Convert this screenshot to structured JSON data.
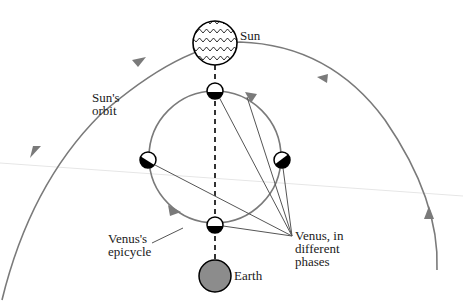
{
  "diagram": {
    "labels": {
      "sun": "Sun",
      "sun_orbit_line1": "Sun's",
      "sun_orbit_line2": "orbit",
      "epicycle_line1": "Venus's",
      "epicycle_line2": "epicycle",
      "phases_line1": "Venus, in",
      "phases_line2": "different",
      "phases_line3": "phases",
      "earth": "Earth"
    },
    "colors": {
      "orbit": "#7a7a7a",
      "earth_fill": "#8c8c8c",
      "outline": "#000000",
      "pointer_line": "#555555"
    },
    "bodies": [
      {
        "name": "Sun",
        "cx": 215,
        "cy": 43,
        "r": 22
      },
      {
        "name": "Earth",
        "cx": 215,
        "cy": 276,
        "r": 16
      }
    ],
    "epicycle": {
      "cx": 215,
      "cy": 157,
      "r": 66
    },
    "venus_positions": [
      {
        "position": "top",
        "cx": 215,
        "cy": 91
      },
      {
        "position": "left",
        "cx": 148,
        "cy": 160
      },
      {
        "position": "right",
        "cx": 282,
        "cy": 160
      },
      {
        "position": "bottom",
        "cx": 215,
        "cy": 225
      }
    ]
  }
}
